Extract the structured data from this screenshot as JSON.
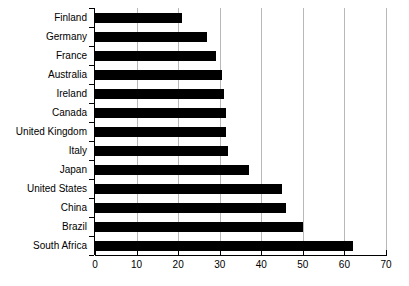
{
  "chart_data": {
    "type": "bar",
    "orientation": "horizontal",
    "title": "",
    "xlabel": "",
    "ylabel": "",
    "xlim": [
      0,
      70
    ],
    "ylim": null,
    "grid": true,
    "legend": null,
    "xticks": [
      "0",
      "10",
      "20",
      "30",
      "40",
      "50",
      "60",
      "70"
    ],
    "xtick_values": [
      0,
      10,
      20,
      30,
      40,
      50,
      60,
      70
    ],
    "categories": [
      "Finland",
      "Germany",
      "France",
      "Australia",
      "Ireland",
      "Canada",
      "United Kingdom",
      "Italy",
      "Japan",
      "United States",
      "China",
      "Brazil",
      "South Africa"
    ],
    "values": [
      21,
      27,
      29,
      30.5,
      31,
      31.5,
      31.5,
      32,
      37,
      45,
      46,
      50,
      62
    ],
    "bar_color": "#000000",
    "grid_color": "#b8b8b8",
    "axis_color": "#000000",
    "background_color": "#ffffff"
  }
}
